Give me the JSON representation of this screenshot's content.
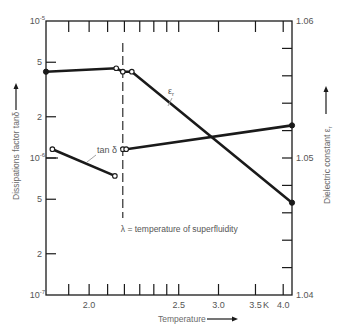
{
  "chart_data": {
    "type": "line",
    "title": "",
    "xlabel": "Temperature",
    "xlabel_arrow": "right-arrow",
    "x_unit_label": "K",
    "x_scale": "reciprocal",
    "xlim": [
      1.8,
      4.19
    ],
    "x_ticks": [
      1.9,
      2.0,
      2.1,
      2.2,
      2.3,
      2.4,
      2.5,
      2.6,
      3.0,
      3.5,
      4.0
    ],
    "x_tick_labels": [
      {
        "text": "2.0",
        "at": 2.0
      },
      {
        "text": "2.5",
        "at": 2.6
      },
      {
        "text": "3.0",
        "at": 3.0
      },
      {
        "text": "3.5",
        "at": 3.5
      },
      {
        "text": "4.0",
        "at": 4.0
      }
    ],
    "left_axis": {
      "label": "Dissipations factor tanδ",
      "arrow": "up-arrow",
      "scale": "log",
      "ylim": [
        1e-07,
        1e-05
      ],
      "ticks": [
        2e-07,
        5e-07,
        1e-06,
        2e-06,
        5e-06
      ],
      "tick_labels": [
        {
          "text": "10",
          "sup": "-5",
          "at": 1e-05
        },
        {
          "text": "5",
          "sup": "",
          "at": 5e-06
        },
        {
          "text": "2",
          "sup": "",
          "at": 2e-06
        },
        {
          "text": "10",
          "sup": "-6",
          "at": 1e-06
        },
        {
          "text": "5",
          "sup": "",
          "at": 5e-07
        },
        {
          "text": "2",
          "sup": "",
          "at": 2e-07
        },
        {
          "text": "10",
          "sup": "-7",
          "at": 1e-07
        }
      ]
    },
    "right_axis": {
      "label": "Dielectric constant ε",
      "label_sub": "r",
      "arrow": "up-arrow",
      "scale": "linear",
      "ylim": [
        1.04,
        1.06
      ],
      "ticks": [
        1.042,
        1.044,
        1.046,
        1.048,
        1.05,
        1.052,
        1.054,
        1.056,
        1.058
      ],
      "tick_labels": [
        {
          "text": "1.06",
          "at": 1.06
        },
        {
          "text": "1.05",
          "at": 1.05
        },
        {
          "text": "1.04",
          "at": 1.04
        }
      ]
    },
    "series": [
      {
        "name": "ε_r",
        "label": "ε",
        "label_sub": "r",
        "axis": "right",
        "segments": [
          [
            {
              "x": 1.8,
              "y": 1.0563,
              "marker": "filled"
            },
            {
              "x": 2.15,
              "y": 1.05655,
              "marker": "open"
            },
            {
              "x": 2.19,
              "y": 1.0563,
              "marker": "open"
            },
            {
              "x": 2.247,
              "y": 1.0563,
              "marker": "open"
            },
            {
              "x": 4.19,
              "y": 1.04674,
              "marker": "filled"
            }
          ]
        ]
      },
      {
        "name": "tan δ",
        "label": "tan δ",
        "label_sub": "",
        "axis": "left",
        "segments": [
          [
            {
              "x": 1.827,
              "y": 1.16e-06,
              "marker": "open"
            },
            {
              "x": 2.142,
              "y": 7.4e-07,
              "marker": "open"
            }
          ],
          [
            {
              "x": 2.19,
              "y": 1.16e-06,
              "marker": "open"
            },
            {
              "x": 2.211,
              "y": 1.16e-06,
              "marker": "open"
            },
            {
              "x": 4.19,
              "y": 1.73e-06,
              "marker": "filled"
            }
          ]
        ]
      }
    ],
    "annotations": [
      {
        "type": "vline",
        "name": "lambda-line",
        "x": 2.19,
        "style": "dashed"
      },
      {
        "type": "text",
        "name": "lambda-note",
        "text": "λ = temperature of superfluidity"
      }
    ],
    "grid": false,
    "legend": "none (inline labels)"
  }
}
